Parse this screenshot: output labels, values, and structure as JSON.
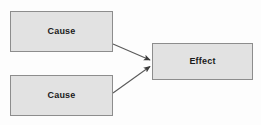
{
  "diagram": {
    "type": "cause-effect",
    "background_color": "#fdfdfd",
    "node_fill_color": "#e2e2e2",
    "node_border_color": "#8d8d8d",
    "edge_color": "#5a5a5a",
    "label_color": "#1a1a1a",
    "nodes": [
      {
        "id": "cause-1",
        "label": "Cause",
        "role": "cause",
        "x": 10,
        "y": 11,
        "width": 103,
        "height": 41
      },
      {
        "id": "cause-2",
        "label": "Cause",
        "role": "cause",
        "x": 10,
        "y": 75,
        "width": 103,
        "height": 41
      },
      {
        "id": "effect-1",
        "label": "Effect",
        "role": "effect",
        "x": 152,
        "y": 43,
        "width": 101,
        "height": 37
      }
    ],
    "edges": [
      {
        "id": "edge-cause1-effect",
        "from": "cause-1",
        "to": "effect-1",
        "arrowhead": "filled-triangle",
        "from_x": 113,
        "from_y": 44,
        "to_x": 151,
        "to_y": 60
      },
      {
        "id": "edge-cause2-effect",
        "from": "cause-2",
        "to": "effect-1",
        "arrowhead": "filled-triangle",
        "from_x": 113,
        "from_y": 93,
        "to_x": 151,
        "to_y": 66
      }
    ]
  }
}
